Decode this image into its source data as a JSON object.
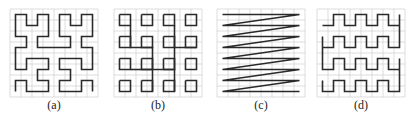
{
  "figure": {
    "panels": [
      {
        "id": "a",
        "label": "(a)",
        "curve": "hilbert",
        "x": 9
      },
      {
        "id": "b",
        "label": "(b)",
        "curve": "squares",
        "x": 113
      },
      {
        "id": "c",
        "label": "(c)",
        "curve": "zigzag",
        "x": 216
      },
      {
        "id": "d",
        "label": "(d)",
        "curve": "serpentine",
        "x": 316
      }
    ],
    "grid_size": 8,
    "colors": {
      "grid": "#c8c8c8",
      "curve": "#2a2a2a"
    }
  }
}
